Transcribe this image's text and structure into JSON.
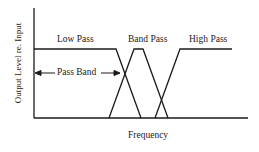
{
  "diagram": {
    "type": "filter-response-diagram",
    "y_axis_label": "Output Level re. Input",
    "x_axis_label": "Frequency",
    "labels": {
      "low_pass": "Low Pass",
      "band_pass": "Band Pass",
      "high_pass": "High Pass",
      "pass_band": "Pass Band"
    },
    "line_color": "#1a1a1a",
    "background": "#ffffff"
  }
}
